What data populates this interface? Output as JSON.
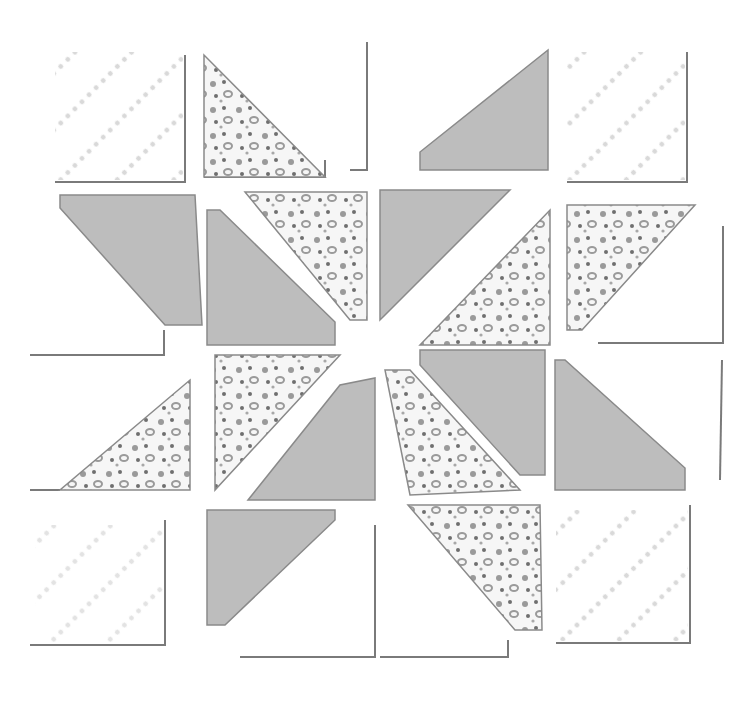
{
  "artwork": {
    "title": "Watercolor quilt block illustration",
    "colors": {
      "background": "#ffffff",
      "solid_fill": "#bdbdbd",
      "solid_fill_dark": "#a9a9a9",
      "outline": "#7a7a7a",
      "floral_dot": "#9a9a9a",
      "floral_dark": "#6f6f6f",
      "faint_dot": "#d6d6d6"
    },
    "grid": {
      "rows": 4,
      "cols": 4
    }
  }
}
